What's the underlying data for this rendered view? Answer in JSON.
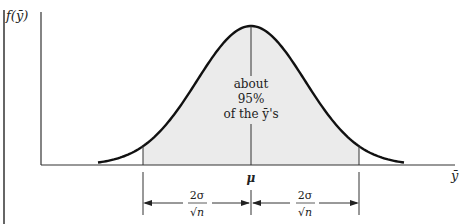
{
  "figure": {
    "y_axis_label": "f(ȳ)",
    "x_axis_label": "ȳ",
    "center_label": "μ",
    "annotation_lines": [
      "about",
      "95%",
      "of the ȳ's"
    ],
    "interval_left_numerator": "2σ",
    "interval_left_denominator": "√n",
    "interval_right_numerator": "2σ",
    "interval_right_denominator": "√n",
    "shaded_fraction_percent": 95,
    "interval_half_width_in_sigma_over_sqrt_n": 2,
    "colors": {
      "curve": "#111111",
      "shade": "#ebebeb",
      "axis": "#333333"
    }
  }
}
